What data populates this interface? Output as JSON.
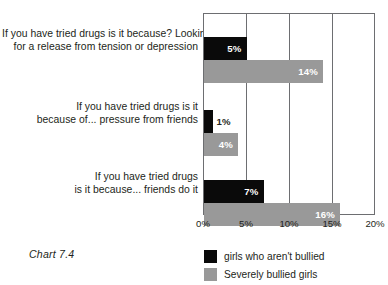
{
  "caption": "Chart 7.4",
  "legend": {
    "position": "bottom",
    "items": [
      {
        "label": "girls who aren't bullied",
        "color": "#0a0a0a",
        "swatch_name": "legend-swatch-not-bullied"
      },
      {
        "label": "Severely bullied girls",
        "color": "#999999",
        "swatch_name": "legend-swatch-severely-bullied"
      }
    ]
  },
  "chart_data": {
    "type": "bar",
    "orientation": "horizontal",
    "title": "",
    "subtitle": "",
    "xlabel": "",
    "ylabel": "",
    "xlim": [
      0,
      20
    ],
    "xunit": "%",
    "grid": true,
    "legend_position": "bottom",
    "tick_labels": [
      "0%",
      "5%",
      "10%",
      "15%",
      "20%"
    ],
    "tick_values": [
      0,
      5,
      10,
      15,
      20
    ],
    "categories": [
      {
        "id": "tension-depression",
        "lines": [
          "If you have tried drugs is it because? Looking",
          "for a release from tension or depression"
        ]
      },
      {
        "id": "pressure-from-friends",
        "lines": [
          "If you have tried drugs is it",
          "because of... pressure from friends"
        ]
      },
      {
        "id": "friends-do-it",
        "lines": [
          "If you have tried drugs",
          "is it because... friends do it"
        ]
      }
    ],
    "series": [
      {
        "name": "girls who aren't bullied",
        "color": "#0a0a0a",
        "values": [
          5,
          1,
          7
        ],
        "labels": [
          "5%",
          "1%",
          "7%"
        ]
      },
      {
        "name": "Severely bullied girls",
        "color": "#999999",
        "values": [
          14,
          4,
          16
        ],
        "labels": [
          "14%",
          "4%",
          "16%"
        ]
      }
    ]
  }
}
